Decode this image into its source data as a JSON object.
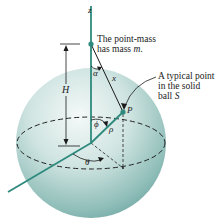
{
  "figure": {
    "axis_label": "z",
    "point_mass_caption_line1": "The point-mass",
    "point_mass_caption_line2_prefix": "has mass ",
    "point_mass_caption_line2_var": "m",
    "point_mass_caption_line2_suffix": ".",
    "typical_point_line1": "A typical point",
    "typical_point_line2": "in the solid",
    "typical_point_line3_prefix": "ball ",
    "typical_point_line3_var": "S",
    "labels": {
      "H": "H",
      "alpha": "α",
      "x": "x",
      "P": "P",
      "phi": "ϕ",
      "rho": "ρ",
      "theta": "θ"
    },
    "colors": {
      "sphere_light": "#eef6f5",
      "sphere_mid": "#b9d8d5",
      "sphere_dark": "#6fa6a2",
      "axis": "#2f8a7e",
      "text": "#1a1a1a"
    }
  }
}
